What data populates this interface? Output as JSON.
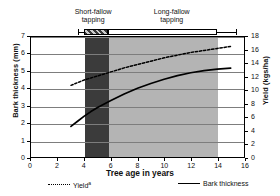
{
  "chart_data": {
    "type": "line",
    "title": "",
    "xlabel": "Tree age in years",
    "ylabel": "Bark thickness (mm)",
    "y2label": "Yield (kgs/ha)",
    "xlim": [
      0,
      16
    ],
    "ylim": [
      0,
      7
    ],
    "y2lim": [
      0,
      18
    ],
    "xticks": [
      0,
      2,
      4,
      6,
      8,
      10,
      12,
      14,
      16
    ],
    "yticks": [
      0,
      1,
      2,
      3,
      4,
      5,
      6,
      7
    ],
    "y2ticks": [
      0,
      2,
      4,
      6,
      8,
      10,
      12,
      14,
      16,
      18
    ],
    "grid": true,
    "legend_position": "bottom",
    "series": [
      {
        "name": "Yield",
        "name_superscript": "a",
        "axis": "right",
        "style": "dashed",
        "x": [
          3.0,
          3.5,
          4.0,
          4.5,
          5.0,
          5.5,
          6.0,
          7.0,
          8.0,
          9.0,
          10.0,
          11.0,
          12.0,
          13.0,
          14.0,
          15.0
        ],
        "values": [
          10.8,
          11.2,
          11.6,
          11.9,
          12.2,
          12.5,
          12.8,
          13.4,
          13.9,
          14.4,
          14.9,
          15.3,
          15.7,
          16.0,
          16.3,
          16.6
        ]
      },
      {
        "name": "Bark thickness",
        "axis": "left",
        "style": "solid",
        "x": [
          3.0,
          3.5,
          4.0,
          4.5,
          5.0,
          5.5,
          6.0,
          7.0,
          8.0,
          9.0,
          10.0,
          11.0,
          12.0,
          13.0,
          14.0,
          15.0
        ],
        "values": [
          1.82,
          2.12,
          2.42,
          2.68,
          2.92,
          3.12,
          3.32,
          3.7,
          4.03,
          4.31,
          4.55,
          4.76,
          4.93,
          5.05,
          5.14,
          5.2
        ]
      }
    ],
    "bands": [
      {
        "name": "short-fallow-band",
        "x_start": 4.0,
        "x_end": 5.8,
        "color": "#3b3b3b"
      },
      {
        "name": "long-fallow-band",
        "x_start": 5.8,
        "x_end": 13.9,
        "color": "#b4b4b4"
      }
    ],
    "annotations": [
      {
        "name": "short-fallow",
        "label": "Short-fallow\ntapping",
        "x_start": 3.6,
        "x_end": 5.8
      },
      {
        "name": "long-fallow",
        "label": "Long-fallow\ntapping",
        "x_start": 5.8,
        "x_end": 15.3
      }
    ]
  },
  "legend": {
    "items": [
      {
        "label": "Yield",
        "superscript": "a",
        "style": "dashed"
      },
      {
        "label": "Bark thickness",
        "superscript": "",
        "style": "solid"
      }
    ]
  },
  "colors": {
    "axis": "#000000",
    "grid": "#7d7d7d",
    "band_dark": "#3b3b3b",
    "band_light": "#b4b4b4",
    "curve": "#000000",
    "background": "#ffffff"
  }
}
